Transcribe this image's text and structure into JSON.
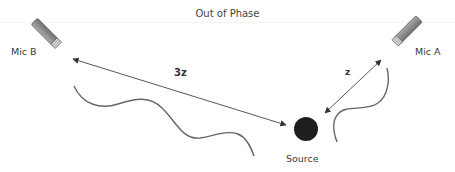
{
  "title": "Out of Phase",
  "mics": [
    {
      "id": "mic-b",
      "label": "Mic B",
      "position": "left"
    },
    {
      "id": "mic-a",
      "label": "Mic A",
      "position": "right"
    }
  ],
  "source": {
    "label": "Source"
  },
  "distances": [
    {
      "label": "3z",
      "from": "Source",
      "to": "Mic B"
    },
    {
      "label": "z",
      "from": "Source",
      "to": "Mic A"
    }
  ],
  "colors": {
    "line": "#555555",
    "wave": "#666666",
    "mic_body": "#8a8a8a",
    "mic_outline": "#6a6a6a",
    "source": "#1e1e1e"
  }
}
